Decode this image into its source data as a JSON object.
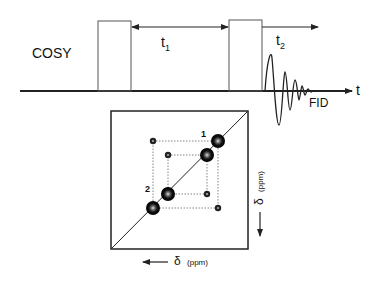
{
  "pulse_sequence": {
    "title": "COSY",
    "delay1_label": "t",
    "delay1_sub": "1",
    "delay2_label": "t",
    "delay2_sub": "2",
    "signal_label": "FID",
    "time_axis_label": "t"
  },
  "spectrum": {
    "peak_label_1": "1",
    "peak_label_2": "2",
    "x_axis_label": "δ",
    "x_axis_unit": "(ppm)",
    "y_axis_label": "δ",
    "y_axis_unit": "(ppm)"
  },
  "colors": {
    "line": "#222222",
    "dotted": "#555555",
    "peak": "#111111"
  }
}
